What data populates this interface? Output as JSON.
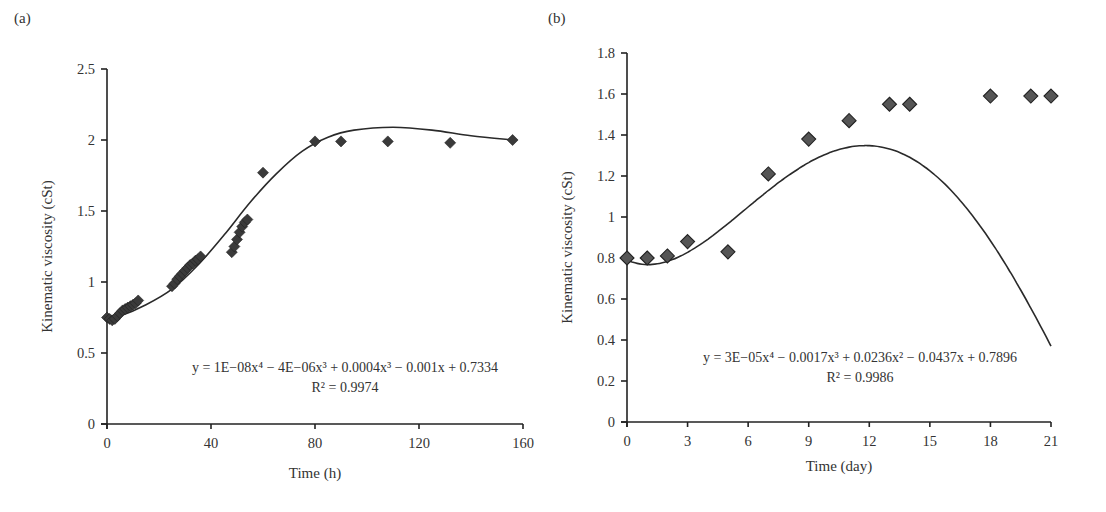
{
  "chart_data": [
    {
      "panel": "(a)",
      "type": "scatter",
      "title": "",
      "xlabel": "Time (h)",
      "ylabel": "Kinematic viscosity (cSt)",
      "xlim": [
        0,
        160
      ],
      "ylim": [
        0,
        2.5
      ],
      "xticks": [
        0,
        40,
        80,
        120,
        160
      ],
      "yticks": [
        0,
        0.5,
        1,
        1.5,
        2,
        2.5
      ],
      "ytick_labels": [
        "0",
        "0.5",
        "1",
        "1.5",
        "2",
        "2.5"
      ],
      "grid": false,
      "legend": null,
      "marker": "diamond",
      "marker_color": "#3a3a3a",
      "series": [
        {
          "name": "Kinematic viscosity",
          "x": [
            0,
            1,
            2,
            3,
            4,
            5,
            6,
            7,
            8,
            9,
            10,
            11,
            12,
            25,
            26,
            27,
            28,
            29,
            30,
            31,
            32,
            33,
            34,
            35,
            36,
            48,
            49,
            50,
            51,
            52,
            53,
            54,
            60,
            80,
            90,
            108,
            132,
            156
          ],
          "y": [
            0.75,
            0.74,
            0.73,
            0.74,
            0.76,
            0.78,
            0.8,
            0.81,
            0.82,
            0.83,
            0.84,
            0.85,
            0.87,
            0.97,
            0.99,
            1.02,
            1.04,
            1.06,
            1.08,
            1.1,
            1.12,
            1.13,
            1.15,
            1.16,
            1.18,
            1.21,
            1.25,
            1.3,
            1.35,
            1.39,
            1.42,
            1.44,
            1.77,
            1.99,
            1.99,
            1.99,
            1.98,
            2.0
          ]
        }
      ],
      "trendline": {
        "type": "polynomial",
        "order": 4,
        "equation": "y = 1E−08x⁴ − 4E−06x³ + 0.0004x³ − 0.001x + 0.7334",
        "r_squared": "R² = 0.9974",
        "coefficients": [
          1e-08,
          -4e-06,
          0.0004,
          -0.001,
          0.7334
        ]
      }
    },
    {
      "panel": "(b)",
      "type": "scatter",
      "title": "",
      "xlabel": "Time (day)",
      "ylabel": "Kinematic viscosity (cSt)",
      "xlim": [
        0,
        21
      ],
      "ylim": [
        0,
        1.8
      ],
      "xticks": [
        0,
        3,
        6,
        9,
        12,
        15,
        18,
        21
      ],
      "yticks": [
        0,
        0.2,
        0.4,
        0.6,
        0.8,
        1.0,
        1.2,
        1.4,
        1.6,
        1.8
      ],
      "ytick_labels": [
        "0",
        "0.2",
        "0.4",
        "0.6",
        "0.8",
        "1",
        "1.2",
        "1.4",
        "1.6",
        "1.8"
      ],
      "grid": false,
      "legend": null,
      "marker": "diamond",
      "marker_color": "#555555",
      "series": [
        {
          "name": "Kinematic viscosity",
          "x": [
            0,
            1,
            2,
            3,
            5,
            7,
            9,
            11,
            13,
            14,
            18,
            20,
            21
          ],
          "y": [
            0.8,
            0.8,
            0.81,
            0.88,
            0.83,
            1.21,
            1.38,
            1.47,
            1.55,
            1.55,
            1.59,
            1.59,
            1.59
          ]
        }
      ],
      "trendline": {
        "type": "polynomial",
        "order": 4,
        "equation": "y = 3E−05x⁴ − 0.0017x³ + 0.0236x² − 0.0437x + 0.7896",
        "r_squared": "R² = 0.9986",
        "coefficients": [
          3e-05,
          -0.0017,
          0.0236,
          -0.0437,
          0.7896
        ]
      }
    }
  ]
}
